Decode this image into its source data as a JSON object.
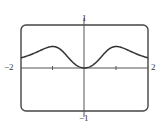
{
  "chart_data": {
    "type": "line",
    "title": "",
    "xlabel": "",
    "ylabel": "",
    "xlim": [
      -2,
      2
    ],
    "ylim": [
      -1,
      1
    ],
    "grid": false,
    "legend": null,
    "tick_labels": {
      "x_min": "−2",
      "x_max": "2",
      "y_max": "1",
      "y_min": "−1"
    },
    "x_ticks": [
      -1,
      1
    ],
    "function": "x^2/(1+x^4)",
    "x": [
      -2,
      -1.75,
      -1.5,
      -1.25,
      -1,
      -0.75,
      -0.5,
      -0.25,
      0,
      0.25,
      0.5,
      0.75,
      1,
      1.25,
      1.5,
      1.75,
      2
    ],
    "y": [
      0.235,
      0.301,
      0.369,
      0.434,
      0.5,
      0.443,
      0.235,
      0.062,
      0,
      0.062,
      0.235,
      0.443,
      0.5,
      0.434,
      0.369,
      0.301,
      0.235
    ],
    "colors": {
      "curve": "#333333",
      "axes": "#555555",
      "frame": "#444444"
    }
  }
}
